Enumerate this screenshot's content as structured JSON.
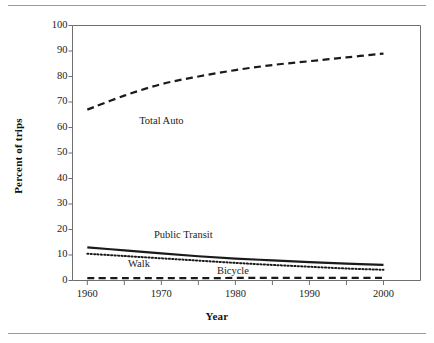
{
  "figure": {
    "background": "#ffffff",
    "rule_color": "#9a9a9a",
    "line_color": "#1a1a1a"
  },
  "chart_data": {
    "type": "line",
    "title": "",
    "xlabel": "Year",
    "ylabel": "Percent of trips",
    "xlim": [
      1958,
      2005
    ],
    "ylim": [
      0,
      100
    ],
    "xticks": [
      1960,
      1970,
      1980,
      1990,
      2000
    ],
    "xtick_labels": [
      "1960",
      "1970",
      "1980",
      "1990",
      "2000"
    ],
    "xminor_ticks": [
      1965,
      1975,
      1985,
      1995
    ],
    "yticks": [
      0,
      10,
      20,
      30,
      40,
      50,
      60,
      70,
      80,
      90,
      100
    ],
    "ytick_labels": [
      "0",
      "10",
      "20",
      "30",
      "40",
      "50",
      "60",
      "70",
      "80",
      "90",
      "100"
    ],
    "grid": false,
    "legend": "inline-annotations",
    "x": [
      1960,
      1965,
      1970,
      1975,
      1980,
      1985,
      1990,
      1995,
      2000
    ],
    "series": [
      {
        "name": "Total Auto",
        "style": "dashed",
        "width": 2.2,
        "color": "#1a1a1a",
        "values": [
          67.0,
          72.5,
          77.0,
          80.0,
          82.5,
          84.5,
          86.0,
          87.5,
          89.0
        ],
        "label_x": 1967,
        "label_y": 62
      },
      {
        "name": "Public Transit",
        "style": "solid",
        "width": 2.2,
        "color": "#1a1a1a",
        "values": [
          13.0,
          11.8,
          10.6,
          9.5,
          8.6,
          7.9,
          7.2,
          6.6,
          6.1
        ],
        "label_x": 1969,
        "label_y": 17.5
      },
      {
        "name": "Walk",
        "style": "dotted",
        "width": 2.0,
        "color": "#1a1a1a",
        "values": [
          10.5,
          9.6,
          8.7,
          7.8,
          6.9,
          6.1,
          5.4,
          4.7,
          4.2
        ],
        "label_x": 1965.5,
        "label_y": 6.0
      },
      {
        "name": "Bicycle",
        "style": "dashed",
        "width": 2.2,
        "color": "#1a1a1a",
        "values": [
          0.9,
          0.9,
          0.9,
          0.9,
          1.0,
          1.0,
          1.0,
          1.0,
          1.0
        ],
        "label_x": 1977.5,
        "label_y": 3.2
      }
    ]
  }
}
